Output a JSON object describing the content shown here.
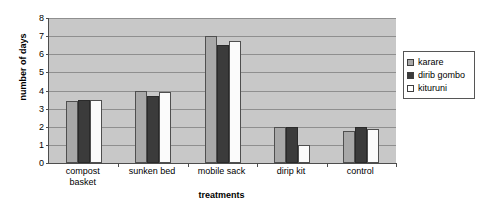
{
  "chart_data": {
    "type": "bar",
    "title": "",
    "xlabel": "treatments",
    "ylabel": "number of days",
    "categories": [
      "compost basket",
      "sunken bed",
      "mobile sack",
      "dirip kit",
      "control"
    ],
    "series": [
      {
        "name": "karare",
        "values": [
          3.4,
          4.0,
          7.0,
          2.0,
          1.75
        ],
        "color": "#a8a8a8"
      },
      {
        "name": "dirib gombo",
        "values": [
          3.5,
          3.7,
          6.5,
          2.0,
          2.0
        ],
        "color": "#3b3b3b"
      },
      {
        "name": "kituruni",
        "values": [
          3.45,
          3.9,
          6.75,
          1.0,
          1.85
        ],
        "color": "#ffffff"
      }
    ],
    "ylim": [
      0,
      8
    ],
    "yticks": [
      0,
      1,
      2,
      3,
      4,
      5,
      6,
      7,
      8
    ],
    "ytick_labels": [
      "0",
      "1",
      "2",
      "3",
      "4",
      "5",
      "6",
      "7",
      "8"
    ],
    "grid": true,
    "legend_position": "right",
    "plot_background": "#c8c8c8",
    "axis_color": "#4d4d4d",
    "gridline_color": "#8f8f8f"
  },
  "legend": {
    "entries": [
      {
        "label": "karare"
      },
      {
        "label": "dirib gombo"
      },
      {
        "label": "kituruni"
      }
    ]
  },
  "axis_titles": {
    "x": "treatments",
    "y": "number of days"
  },
  "category_labels": [
    "compost\nbasket",
    "sunken bed",
    "mobile sack",
    "dirip kit",
    "control"
  ]
}
